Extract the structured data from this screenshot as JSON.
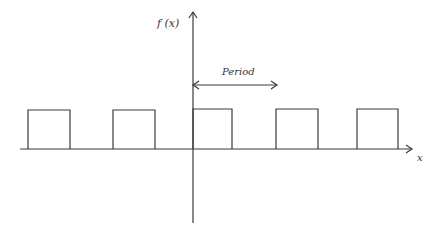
{
  "diagram": {
    "y_axis_label": "f (x)",
    "x_axis_label": "x",
    "period_label": "Period",
    "colors": {
      "line": "#3a3a3a",
      "background": "#ffffff"
    },
    "pulses": [
      {
        "x1": 28,
        "x2": 70
      },
      {
        "x1": 113,
        "x2": 155
      },
      {
        "x1": 193,
        "x2": 232
      },
      {
        "x1": 276,
        "x2": 318
      },
      {
        "x1": 357,
        "x2": 398
      }
    ]
  }
}
